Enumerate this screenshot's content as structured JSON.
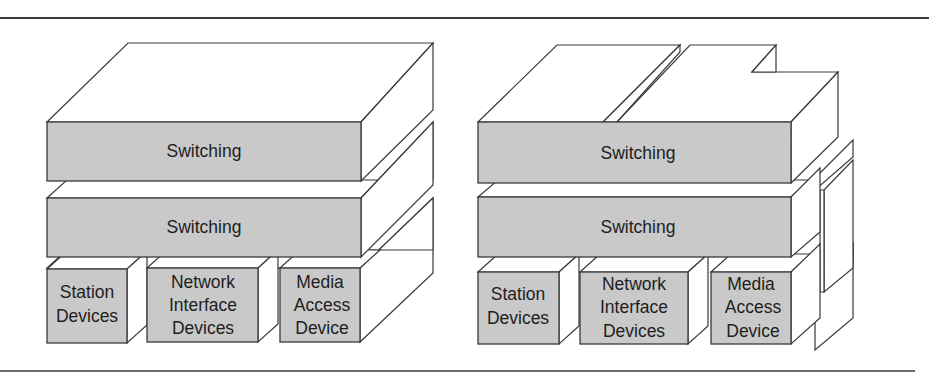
{
  "diagram": {
    "colors": {
      "front_face": "#c9c9c9",
      "top_side_faces": "#ffffff",
      "outline": "#3a3a3a",
      "rule": "#3c3c3c"
    },
    "left_stack": {
      "layers": [
        {
          "label": "Switching"
        },
        {
          "label": "Switching"
        }
      ],
      "devices": [
        {
          "line1": "Station",
          "line2": "Devices",
          "line3": ""
        },
        {
          "line1": "Network",
          "line2": "Interface",
          "line3": "Devices"
        },
        {
          "line1": "Media",
          "line2": "Access",
          "line3": "Device"
        }
      ]
    },
    "right_stack": {
      "layers": [
        {
          "label": "Switching"
        },
        {
          "label": "Switching"
        }
      ],
      "devices": [
        {
          "line1": "Station",
          "line2": "Devices",
          "line3": ""
        },
        {
          "line1": "Network",
          "line2": "Interface",
          "line3": "Devices"
        },
        {
          "line1": "Media",
          "line2": "Access",
          "line3": "Device"
        }
      ]
    }
  }
}
